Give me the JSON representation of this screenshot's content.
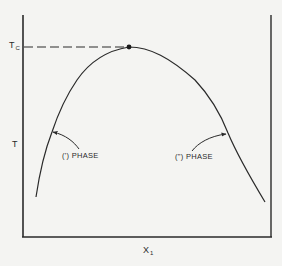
{
  "diagram": {
    "type": "phase-diagram-coexistence-curve",
    "y_axis": {
      "label": "T",
      "critical_label": "T",
      "critical_label_subscript": "C"
    },
    "x_axis": {
      "label": "X",
      "label_subscript": "1"
    },
    "left_branch_label": "(') PHASE",
    "right_branch_label": "(\") PHASE",
    "critical_point": {
      "description": "maximum of curve at T_C",
      "dashed_line_to_axis": true
    },
    "colors": {
      "background": "#f4f4f2",
      "ink": "#2a2a2a"
    }
  }
}
